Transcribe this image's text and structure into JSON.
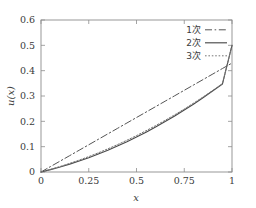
{
  "chart_data": {
    "type": "line",
    "title": "",
    "xlabel": "x",
    "ylabel": "u(x)",
    "xlim": [
      0,
      1
    ],
    "ylim": [
      0,
      0.6
    ],
    "grid": false,
    "legend_position": "top-right-inside",
    "xticks": [
      0,
      0.25,
      0.5,
      0.75,
      1
    ],
    "xticklabels": [
      "0",
      "0.25",
      "0.5",
      "0.75",
      "1"
    ],
    "yticks": [
      0,
      0.1,
      0.2,
      0.3,
      0.4,
      0.5,
      0.6
    ],
    "yticklabels": [
      "0",
      "0.1",
      "0.2",
      "0.3",
      "0.4",
      "0.5",
      "0.6"
    ],
    "x": [
      0,
      0.05,
      0.1,
      0.15,
      0.2,
      0.25,
      0.3,
      0.35,
      0.4,
      0.45,
      0.5,
      0.55,
      0.6,
      0.65,
      0.7,
      0.75,
      0.8,
      0.85,
      0.9,
      0.95,
      1
    ],
    "series": [
      {
        "name": "1次",
        "label": "1次",
        "linestyle": "dashdot",
        "color": "#555555",
        "values": [
          0,
          0.0215,
          0.043,
          0.0645,
          0.086,
          0.1075,
          0.129,
          0.1505,
          0.172,
          0.1935,
          0.215,
          0.2365,
          0.258,
          0.2795,
          0.301,
          0.3225,
          0.344,
          0.3655,
          0.387,
          0.4085,
          0.43
        ]
      },
      {
        "name": "2次",
        "label": "2次",
        "linestyle": "solid",
        "color": "#4a4a4a",
        "values": [
          0,
          0.0093,
          0.0196,
          0.0309,
          0.0432,
          0.0565,
          0.0708,
          0.0861,
          0.1024,
          0.1197,
          0.138,
          0.1573,
          0.1776,
          0.1989,
          0.2212,
          0.2445,
          0.2688,
          0.2941,
          0.3204,
          0.3477,
          0.5
        ]
      },
      {
        "name": "3次",
        "label": "3次",
        "linestyle": "dotted",
        "color": "#777777",
        "values": [
          0,
          0.0105,
          0.0218,
          0.0339,
          0.047,
          0.0609,
          0.0757,
          0.0914,
          0.108,
          0.1254,
          0.1437,
          0.1629,
          0.183,
          0.204,
          0.2259,
          0.2486,
          0.2723,
          0.2969,
          0.3223,
          0.3487,
          0.5
        ]
      }
    ],
    "annotations": []
  },
  "legend": {
    "entries": [
      {
        "label": "1次",
        "style": "dashdot"
      },
      {
        "label": "2次",
        "style": "solid"
      },
      {
        "label": "3次",
        "style": "dotted"
      }
    ]
  },
  "axes": {
    "x_title": "x",
    "y_title": "u(x)"
  }
}
